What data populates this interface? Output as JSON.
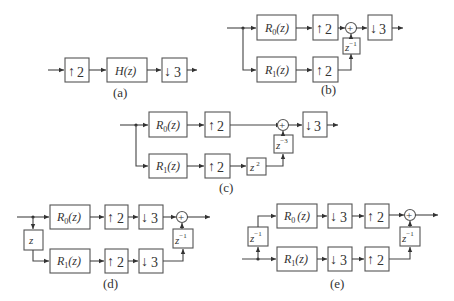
{
  "diagram": {
    "panels": [
      {
        "id": "a",
        "label": "(a)",
        "blocks": [
          {
            "name": "upsample-2",
            "glyph": "↑",
            "text": "2"
          },
          {
            "name": "filter-H",
            "text": "H(z)"
          },
          {
            "name": "downsample-3",
            "glyph": "↓",
            "text": "3"
          }
        ]
      },
      {
        "id": "b",
        "label": "(b)",
        "blocks": [
          {
            "name": "R0",
            "base": "R",
            "sub": "0",
            "arg": "(z)"
          },
          {
            "name": "R1",
            "base": "R",
            "sub": "1",
            "arg": "(z)"
          },
          {
            "name": "up2-top",
            "glyph": "↑",
            "text": "2"
          },
          {
            "name": "up2-bottom",
            "glyph": "↑",
            "text": "2"
          },
          {
            "name": "delay",
            "base": "z",
            "sup": "−1"
          },
          {
            "name": "down3",
            "glyph": "↓",
            "text": "3"
          }
        ],
        "adder": "+"
      },
      {
        "id": "c",
        "label": "(c)",
        "blocks": [
          {
            "name": "R0",
            "base": "R",
            "sub": "0",
            "arg": "(z)"
          },
          {
            "name": "R1",
            "base": "R",
            "sub": "1",
            "arg": "(z)"
          },
          {
            "name": "up2-top",
            "glyph": "↑",
            "text": "2"
          },
          {
            "name": "up2-bottom",
            "glyph": "↑",
            "text": "2"
          },
          {
            "name": "advance",
            "base": "z",
            "sup": "2"
          },
          {
            "name": "delay",
            "base": "z",
            "sup": "−3"
          },
          {
            "name": "down3",
            "glyph": "↓",
            "text": "3"
          }
        ],
        "adder": "+"
      },
      {
        "id": "d",
        "label": "(d)",
        "blocks": [
          {
            "name": "advance-z",
            "base": "z"
          },
          {
            "name": "R0",
            "base": "R",
            "sub": "0",
            "arg": "(z)"
          },
          {
            "name": "R1",
            "base": "R",
            "sub": "1",
            "arg": "(z)"
          },
          {
            "name": "up2-top",
            "glyph": "↑",
            "text": "2"
          },
          {
            "name": "up2-bottom",
            "glyph": "↑",
            "text": "2"
          },
          {
            "name": "down3-top",
            "glyph": "↓",
            "text": "3"
          },
          {
            "name": "down3-bottom",
            "glyph": "↓",
            "text": "3"
          },
          {
            "name": "delay",
            "base": "z",
            "sup": "−1"
          }
        ],
        "adder": "+"
      },
      {
        "id": "e",
        "label": "(e)",
        "blocks": [
          {
            "name": "delay-in",
            "base": "z",
            "sup": "−1"
          },
          {
            "name": "R0",
            "base": "R",
            "sub": "0",
            "arg": "(z)"
          },
          {
            "name": "R1",
            "base": "R",
            "sub": "1",
            "arg": "(z)"
          },
          {
            "name": "down3-top",
            "glyph": "↓",
            "text": "3"
          },
          {
            "name": "down3-bottom",
            "glyph": "↓",
            "text": "3"
          },
          {
            "name": "up2-top",
            "glyph": "↑",
            "text": "2"
          },
          {
            "name": "up2-bottom",
            "glyph": "↑",
            "text": "2"
          },
          {
            "name": "delay-out",
            "base": "z",
            "sup": "−1"
          }
        ],
        "adder": "+"
      }
    ]
  },
  "colors": {
    "line": "#444444",
    "box": "#555555",
    "text": "#333333",
    "background": "#ffffff"
  }
}
